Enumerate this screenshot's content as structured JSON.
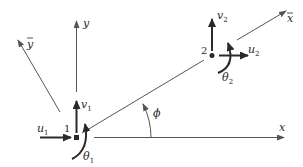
{
  "diagram": {
    "type": "beam element local/global coordinate systems",
    "colors": {
      "line": "#555555",
      "arrow": "#2a2a2a",
      "text": "#2a2a2a",
      "background": "#ffffff"
    },
    "axes": {
      "x": {
        "label": "x"
      },
      "y": {
        "label": "y"
      },
      "x_bar": {
        "label": "x",
        "overbar": true
      },
      "y_bar": {
        "label": "y",
        "overbar": true
      }
    },
    "angle": {
      "label": "ϕ"
    },
    "nodes": [
      {
        "id": "1",
        "label": "1",
        "u": {
          "base": "u",
          "sub": "1"
        },
        "v": {
          "base": "v",
          "sub": "1"
        },
        "theta": {
          "base": "θ",
          "sub": "1"
        }
      },
      {
        "id": "2",
        "label": "2",
        "u": {
          "base": "u",
          "sub": "2"
        },
        "v": {
          "base": "v",
          "sub": "2"
        },
        "theta": {
          "base": "θ",
          "sub": "2"
        }
      }
    ]
  }
}
